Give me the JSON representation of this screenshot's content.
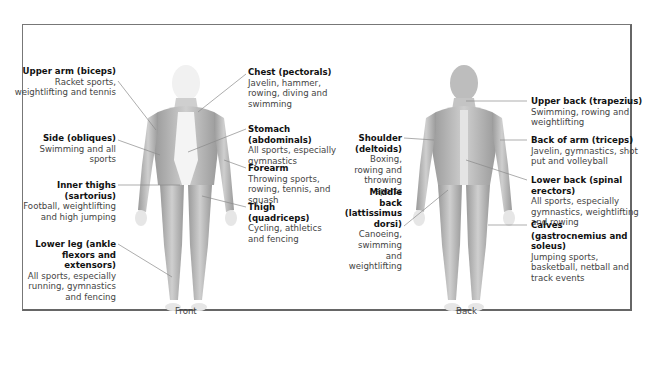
{
  "figures": [
    {
      "caption": "Front",
      "labels": [
        {
          "id": "biceps",
          "title": "Upper arm (biceps)",
          "desc": "Racket sports, weightlifting and tennis",
          "side": "left"
        },
        {
          "id": "obliques",
          "title": "Side (obliques)",
          "desc": "Swimming and all sports",
          "side": "left"
        },
        {
          "id": "sartorius",
          "title": "Inner thighs (sartorius)",
          "desc": "Football, weightlifting and high jumping",
          "side": "left"
        },
        {
          "id": "ankle",
          "title": "Lower leg (ankle flexors and extensors)",
          "desc": "All sports, especially running, gymnastics and fencing",
          "side": "left"
        },
        {
          "id": "pectorals",
          "title": "Chest (pectorals)",
          "desc": "Javelin, hammer, rowing, diving and swimming",
          "side": "right"
        },
        {
          "id": "abdominals",
          "title": "Stomach (abdominals)",
          "desc": "All sports, especially gymnastics",
          "side": "right"
        },
        {
          "id": "forearm",
          "title": "Forearm",
          "desc": "Throwing sports, rowing, tennis, and squash",
          "side": "right"
        },
        {
          "id": "quadriceps",
          "title": "Thigh (quadriceps)",
          "desc": "Cycling, athletics and fencing",
          "side": "right"
        }
      ]
    },
    {
      "caption": "Back",
      "labels": [
        {
          "id": "deltoids",
          "title": "Shoulder (deltoids)",
          "desc": "Boxing, rowing and throwing sports",
          "side": "left"
        },
        {
          "id": "latissimus",
          "title": "Middle back (lattissimus dorsi)",
          "desc": "Canoeing, swimming and weightlifting",
          "side": "left"
        },
        {
          "id": "trapezius",
          "title": "Upper back (trapezius)",
          "desc": "Swimming, rowing and weightlifting",
          "side": "right"
        },
        {
          "id": "triceps",
          "title": "Back of arm (triceps)",
          "desc": "Javelin, gymnastics, shot put and volleyball",
          "side": "right"
        },
        {
          "id": "spinal",
          "title": "Lower back (spinal erectors)",
          "desc": "All sports, especially gymnastics, weightlifting and rowing",
          "side": "right"
        },
        {
          "id": "calves",
          "title": "Calves (gastrocnemius and soleus)",
          "desc": "Jumping sports, basketball, netball and track events",
          "side": "right"
        }
      ]
    }
  ],
  "colors": {
    "muscle": "#b8b8b8",
    "muscle_dark": "#8e8e8e",
    "skin": "#efefef",
    "border": "#777777",
    "leader": "#8a8a8a"
  }
}
